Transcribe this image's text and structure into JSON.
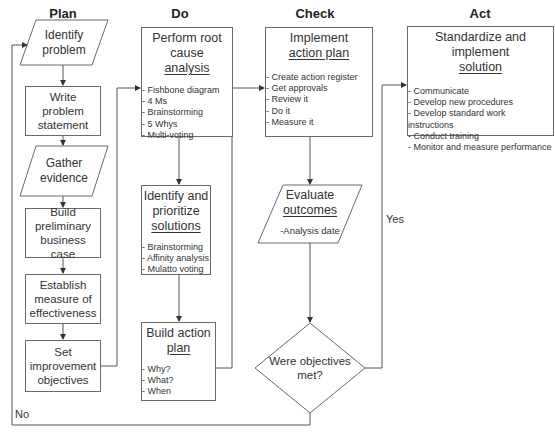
{
  "columns": {
    "plan": "Plan",
    "do": "Do",
    "check": "Check",
    "act": "Act"
  },
  "plan": {
    "identify_problem": "Identify problem",
    "write_problem_statement": "Write problem statement",
    "gather_evidence": "Gather evidence",
    "build_business_case": "Build preliminary business case",
    "establish_measure": "Establish measure of effectiveness",
    "set_objectives": "Set improvement objectives"
  },
  "do": {
    "root_cause": {
      "title_line1": "Perform root",
      "title_line2": "cause",
      "title_underlined": "analysis",
      "items": [
        "Fishbone diagram",
        "4 Ms",
        "Brainstorming",
        "5 Whys",
        "Multi-voting"
      ]
    },
    "prioritize": {
      "title_line1": "Identify and",
      "title_line2": "prioritize",
      "title_underlined": "solutions",
      "items": [
        "Brainstorming",
        "Affinity analysis",
        "Mulatto voting"
      ]
    },
    "action_plan": {
      "title_line1": "Build action",
      "title_underlined": "plan",
      "items": [
        "Why?",
        "What?",
        "When"
      ]
    }
  },
  "check": {
    "implement": {
      "title_line1": "Implement",
      "title_underlined": "action plan",
      "items": [
        "Create action register",
        "Get approvals",
        "Review it",
        "Do it",
        "Measure it"
      ]
    },
    "evaluate": {
      "title_line1": "Evaluate",
      "title_underlined": "outcomes",
      "detail": "-Analysis date"
    },
    "decision": {
      "line1": "Were objectives",
      "line2": "met?"
    }
  },
  "act": {
    "standardize": {
      "title_line1": "Standardize and implement",
      "title_underlined": "solution",
      "items": [
        "Communicate",
        "Develop new procedures",
        "Develop standard work instructions",
        "Conduct training",
        "Monitor and measure performance"
      ]
    }
  },
  "edges": {
    "yes_label": "Yes",
    "no_label": "No"
  },
  "colors": {
    "line": "#555555",
    "box_border": "#6a6a6a",
    "text": "#333333"
  }
}
